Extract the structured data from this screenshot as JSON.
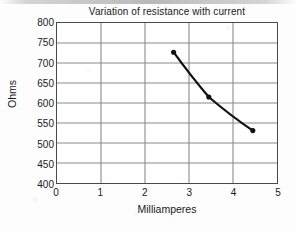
{
  "chart_data": {
    "type": "line",
    "title": "Variation of resistance with current",
    "xlabel": "Milliamperes",
    "ylabel": "Ohms",
    "xlim": [
      0,
      5
    ],
    "ylim": [
      400,
      800
    ],
    "xticks": [
      0,
      1,
      2,
      3,
      4,
      5
    ],
    "yticks": [
      400,
      450,
      500,
      550,
      600,
      650,
      700,
      750,
      800
    ],
    "grid": true,
    "legend": "none",
    "series": [
      {
        "name": "resistance",
        "marker": "filled-circle",
        "color": "#111111",
        "linewidth": 2.2,
        "x": [
          2.65,
          3.45,
          4.45
        ],
        "y": [
          727,
          615,
          531
        ],
        "points": [
          {
            "x": 2.65,
            "y": 727
          },
          {
            "x": 3.45,
            "y": 615
          },
          {
            "x": 4.45,
            "y": 531
          }
        ]
      }
    ]
  },
  "colors": {
    "axis": "#4a4a4a",
    "grid": "#8a8a8a",
    "data": "#111111",
    "text": "#1a1a1a",
    "background": "#ffffff"
  }
}
